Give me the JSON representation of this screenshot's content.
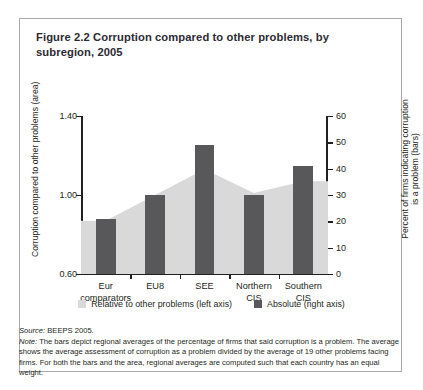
{
  "figure": {
    "title": "Figure 2.2  Corruption compared to other problems, by subregion, 2005"
  },
  "chart_data": {
    "type": "bar",
    "title": "Corruption compared to other problems, by subregion, 2005",
    "categories": [
      "Eur comparators",
      "EU8",
      "SEE",
      "Northern CIS",
      "Southern CIS"
    ],
    "category_lines": [
      [
        "Eur",
        "comparators"
      ],
      [
        "EU8",
        ""
      ],
      [
        "SEE",
        ""
      ],
      [
        "Northern",
        "CIS"
      ],
      [
        "Southern",
        "CIS"
      ]
    ],
    "series": [
      {
        "name": "Relative to other problems (left axis)",
        "type": "area",
        "axis": "left",
        "color": "#d9d9d9",
        "values": [
          0.87,
          1.0,
          1.13,
          1.01,
          1.07
        ]
      },
      {
        "name": "Absolute (right axis)",
        "type": "bar",
        "axis": "right",
        "color": "#58585b",
        "values": [
          21,
          30,
          49,
          30,
          41
        ]
      }
    ],
    "ylabel": "Corruption compared to other problems (area)",
    "ylabel_right_line1": "Percent of firms indicating corruption",
    "ylabel_right_line2": "is a problem (bars)",
    "xlabel": "",
    "ylim": [
      0.6,
      1.4
    ],
    "yticks": [
      "0.60",
      "1.00",
      "1.40"
    ],
    "ylim_right": [
      0,
      60
    ],
    "yticks_right": [
      "0",
      "10",
      "20",
      "30",
      "40",
      "50",
      "60"
    ],
    "grid": false,
    "legend_position": "bottom"
  },
  "legend": {
    "area_label": "Relative to other problems (left axis)",
    "bar_label": "Absolute (right axis)"
  },
  "notes": {
    "source_label": "Source:",
    "source_text": " BEEPS 2005.",
    "note_label": "Note:",
    "note_text": " The bars depict regional averages of the percentage of firms that said corruption is a problem. The average shows the average assessment of corruption as a problem divided by the average of 19 other problems facing firms. For both the bars and the area, regional averages are computed such that each country has an equal weight."
  }
}
